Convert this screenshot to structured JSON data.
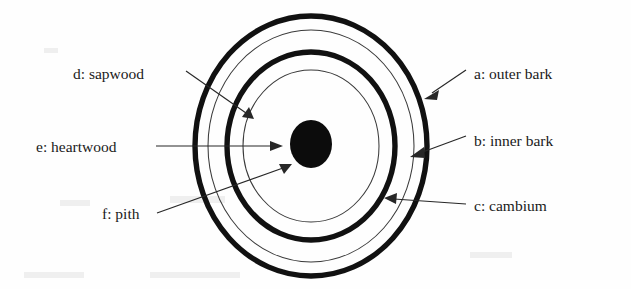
{
  "figure": {
    "background_color": "#fefefe",
    "ink_color": "#111111",
    "width": 631,
    "height": 289
  },
  "diagram": {
    "type": "labeled-cross-section",
    "center": {
      "x": 311,
      "y": 146
    },
    "rings": [
      {
        "key": "a",
        "name": "outer-bark-ring",
        "style": "thick",
        "rx": 116,
        "ry": 130,
        "stroke": "#111111",
        "stroke_width": 5.4
      },
      {
        "key": "b",
        "name": "inner-bark-ring",
        "style": "thin",
        "rx": 103,
        "ry": 116,
        "stroke": "#3a3a3a",
        "stroke_width": 1.05
      },
      {
        "key": "c",
        "name": "cambium-ring",
        "style": "thick",
        "rx": 84,
        "ry": 94,
        "stroke": "#111111",
        "stroke_width": 5.4
      },
      {
        "key": "d",
        "name": "sapwood-ring",
        "style": "thin",
        "rx": 68,
        "ry": 76,
        "stroke": "#3a3a3a",
        "stroke_width": 1.05
      },
      {
        "key": "e",
        "name": "heartwood-ring",
        "style": "thin",
        "rx": 0,
        "ry": 0,
        "stroke": "#3a3a3a",
        "stroke_width": 0
      }
    ],
    "pith": {
      "key": "f",
      "name": "pith-core",
      "cx": 311,
      "cy": 144,
      "rx": 21,
      "ry": 24,
      "fill": "#0c0c0c"
    }
  },
  "labels": [
    {
      "key": "a",
      "id": "outer-bark",
      "text": "a: outer bark",
      "text_x": 474,
      "text_y": 79,
      "anchor": "start",
      "leader": {
        "x1": 466,
        "y1": 71,
        "x2": 429,
        "y2": 96
      },
      "arrow_angle_deg": 146
    },
    {
      "key": "b",
      "id": "inner-bark",
      "text": "b: inner bark",
      "text_x": 474,
      "text_y": 146,
      "anchor": "start",
      "leader": {
        "x1": 466,
        "y1": 138,
        "x2": 414,
        "y2": 157
      },
      "arrow_angle_deg": 160
    },
    {
      "key": "c",
      "id": "cambium",
      "text": "c: cambium",
      "text_x": 474,
      "text_y": 211,
      "anchor": "start",
      "leader": {
        "x1": 466,
        "y1": 205,
        "x2": 386,
        "y2": 200
      },
      "arrow_angle_deg": 184
    },
    {
      "key": "d",
      "id": "sapwood",
      "text": "d: sapwood",
      "text_x": 73,
      "text_y": 79,
      "anchor": "start",
      "leader": {
        "x1": 186,
        "y1": 72,
        "x2": 252,
        "y2": 118
      },
      "arrow_angle_deg": 35
    },
    {
      "key": "e",
      "id": "heartwood",
      "text": "e: heartwood",
      "text_x": 36,
      "text_y": 152,
      "anchor": "start",
      "leader": {
        "x1": 156,
        "y1": 146,
        "x2": 278,
        "y2": 146
      },
      "arrow_angle_deg": 0
    },
    {
      "key": "f",
      "id": "pith",
      "text": "f: pith",
      "text_x": 102,
      "text_y": 219,
      "anchor": "start",
      "leader": {
        "x1": 157,
        "y1": 213,
        "x2": 289,
        "y2": 165
      },
      "arrow_angle_deg": -20
    }
  ],
  "legend_keys": {
    "a": "outer bark",
    "b": "inner bark",
    "c": "cambium",
    "d": "sapwood",
    "e": "heartwood",
    "f": "pith"
  }
}
